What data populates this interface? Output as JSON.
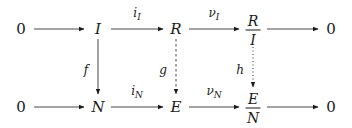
{
  "diagram": {
    "type": "commutative-diagram",
    "top_row": {
      "zero_left": "0",
      "I": "I",
      "R": "R",
      "quotient_num": "R",
      "quotient_den": "I",
      "zero_right": "0"
    },
    "bottom_row": {
      "zero_left": "0",
      "N": "N",
      "E": "E",
      "quotient_num": "E",
      "quotient_den": "N",
      "zero_right": "0"
    },
    "labels": {
      "iI_base": "i",
      "iI_sub": "I",
      "nuI_base": "ν",
      "nuI_sub": "I",
      "iN_base": "i",
      "iN_sub": "N",
      "nuN_base": "ν",
      "nuN_sub": "N",
      "f": "f",
      "g": "g",
      "h": "h"
    },
    "edges": [
      {
        "from": "0",
        "to": "I",
        "style": "solid"
      },
      {
        "from": "I",
        "to": "R",
        "label": "i_I",
        "style": "solid"
      },
      {
        "from": "R",
        "to": "R/I",
        "label": "ν_I",
        "style": "solid"
      },
      {
        "from": "R/I",
        "to": "0",
        "style": "solid"
      },
      {
        "from": "0",
        "to": "N",
        "style": "solid"
      },
      {
        "from": "N",
        "to": "E",
        "label": "i_N",
        "style": "solid"
      },
      {
        "from": "E",
        "to": "E/N",
        "label": "ν_N",
        "style": "solid"
      },
      {
        "from": "E/N",
        "to": "0",
        "style": "solid"
      },
      {
        "from": "I",
        "to": "N",
        "label": "f",
        "style": "solid"
      },
      {
        "from": "R",
        "to": "E",
        "label": "g",
        "style": "dashed"
      },
      {
        "from": "R/I",
        "to": "E/N",
        "label": "h",
        "style": "dotted"
      }
    ]
  }
}
